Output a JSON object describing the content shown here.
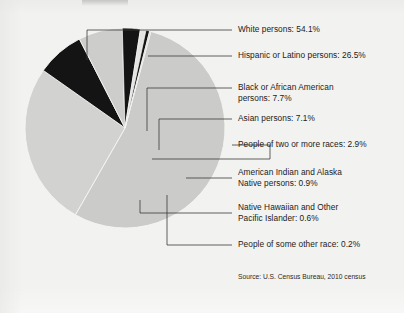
{
  "figure": {
    "background_color": "#f2f2f0",
    "source_note": "Source: U.S. Census Bureau, 2010 census"
  },
  "chart_data": {
    "type": "pie",
    "title": "",
    "xlabel": "",
    "ylabel": "",
    "legend_position": "right-callout-labels",
    "grid": false,
    "units": "percent",
    "categories": [
      "White persons",
      "Hispanic or Latino persons",
      "Black or African American persons",
      "Asian persons",
      "People of two or more races",
      "American Indian and Alaska Native persons",
      "Native Hawaiian and Other Pacific Islander",
      "People of some other race"
    ],
    "values": [
      54.1,
      26.5,
      7.7,
      7.1,
      2.9,
      0.9,
      0.6,
      0.2
    ],
    "slice_colors": [
      "#cbcbc9",
      "#d2d2d0",
      "#141414",
      "#cdcdcb",
      "#141414",
      "#e4e4e2",
      "#141414",
      "#d2d2d0"
    ],
    "slices": [
      {
        "name": "White persons",
        "value": 54.1,
        "label_line1": "White persons: 54.1%",
        "label_line2": "",
        "color": "#cbcbc9"
      },
      {
        "name": "Hispanic or Latino persons",
        "value": 26.5,
        "label_line1": "Hispanic or Latino persons: 26.5%",
        "label_line2": "",
        "color": "#d2d2d0"
      },
      {
        "name": "Black or African American persons",
        "value": 7.7,
        "label_line1": "Black or African American",
        "label_line2": "persons: 7.7%",
        "color": "#141414"
      },
      {
        "name": "Asian persons",
        "value": 7.1,
        "label_line1": "Asian persons: 7.1%",
        "label_line2": "",
        "color": "#cdcdcb"
      },
      {
        "name": "People of two or more races",
        "value": 2.9,
        "label_line1": "People of two or more races: 2.9%",
        "label_line2": "",
        "color": "#141414"
      },
      {
        "name": "American Indian and Alaska Native persons",
        "value": 0.9,
        "label_line1": "American Indian and Alaska",
        "label_line2": "Native persons: 0.9%",
        "color": "#e4e4e2"
      },
      {
        "name": "Native Hawaiian and Other Pacific Islander",
        "value": 0.6,
        "label_line1": "Native Hawaiian and Other",
        "label_line2": "Pacific Islander: 0.6%",
        "color": "#141414"
      },
      {
        "name": "People of some other race",
        "value": 0.2,
        "label_line1": "People of some other race: 0.2%",
        "label_line2": "",
        "color": "#d2d2d0"
      }
    ]
  },
  "geometry": {
    "center_x": 125,
    "center_y": 128,
    "radius": 100
  }
}
